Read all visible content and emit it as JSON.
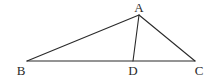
{
  "diagram": {
    "type": "triangle-with-cevian",
    "points": {
      "A": {
        "x": 139,
        "y": 15,
        "label": "A",
        "lx": 139,
        "ly": 12
      },
      "B": {
        "x": 27,
        "y": 61,
        "label": "B",
        "lx": 21,
        "ly": 75
      },
      "C": {
        "x": 195,
        "y": 61,
        "label": "C",
        "lx": 199,
        "ly": 75
      },
      "D": {
        "x": 133,
        "y": 61,
        "label": "D",
        "lx": 133,
        "ly": 75
      }
    },
    "segments": [
      {
        "from": "A",
        "to": "B",
        "name": "segment-ab"
      },
      {
        "from": "A",
        "to": "C",
        "name": "segment-ac"
      },
      {
        "from": "B",
        "to": "C",
        "name": "segment-bc"
      },
      {
        "from": "A",
        "to": "D",
        "name": "segment-ad"
      }
    ],
    "stroke_color": "#2a2a2a",
    "background": "#ffffff"
  }
}
